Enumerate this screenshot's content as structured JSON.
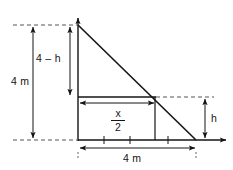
{
  "figure": {
    "labels": {
      "height_total": "4 m",
      "height_upper": "4 – h",
      "height_lower": "h",
      "base_total": "4 m",
      "base_partial_numerator": "x",
      "base_partial_denominator": "2"
    },
    "colors": {
      "line": "#141414",
      "dashed": "#555555",
      "background": "#ffffff"
    },
    "geometry": {
      "apex": [
        78,
        25
      ],
      "base_right": [
        196,
        140
      ],
      "origin": [
        78,
        140
      ],
      "inner_vertical_x": 155,
      "mid_line_y": 97,
      "axis_y": 140,
      "top_dash_y": 25
    }
  }
}
